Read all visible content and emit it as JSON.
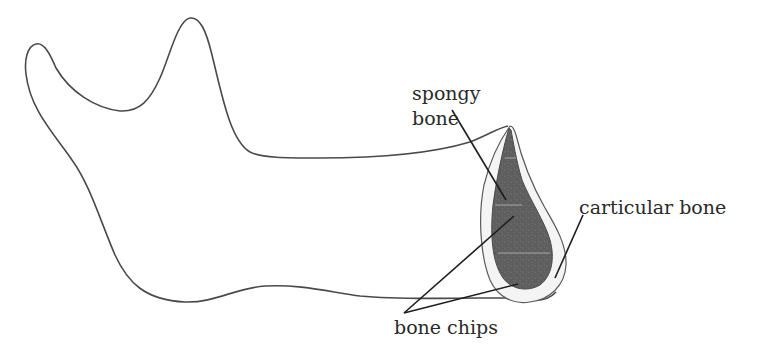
{
  "diagram": {
    "colors": {
      "outline": "#4a4a4a",
      "spongy_bone_fill": "#5e5e5e",
      "cortical_shell_fill": "#f4f4f4",
      "leader_line": "#1e1e1e",
      "text": "#2a2a2a"
    },
    "labels": {
      "spongy_bone_line1": "spongy",
      "spongy_bone_line2": "bone",
      "carticular_bone": "carticular bone",
      "bone_chips": "bone chips"
    }
  }
}
